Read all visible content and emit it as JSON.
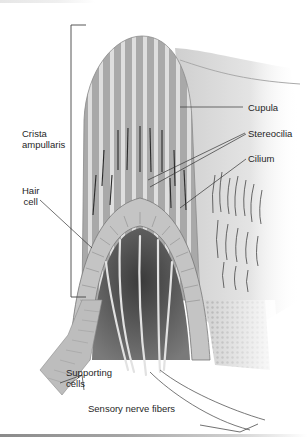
{
  "figure": {
    "labels": {
      "crista_ampullaris": "Crista ampullaris",
      "crista_line1": "Crista",
      "crista_line2": "ampullaris",
      "hair_cell_line1": "Hair",
      "hair_cell_line2": "cell",
      "cupula": "Cupula",
      "stereocilia": "Stereocilia",
      "cilium": "Cilium",
      "supporting_line1": "Supporting",
      "supporting_line2": "cells",
      "sensory_nerve_fibers": "Sensory nerve fibers"
    },
    "colors": {
      "background": "#ffffff",
      "leader_line": "#333333",
      "cupula_stripe_dark": "#9a9a9a",
      "cupula_stripe_light": "#d9d9d9",
      "tissue": "#b8b8b8",
      "bottom_bar": "#8a8a8a"
    }
  }
}
